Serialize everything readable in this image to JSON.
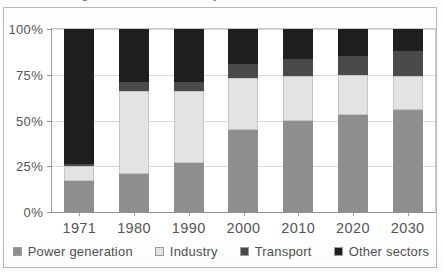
{
  "figure": {
    "title_cropped": "Figure 1: CO2 emissions by sector",
    "background_color": "#ffffff",
    "frame_color": "#b9b9b9"
  },
  "axis": {
    "y_ticks": [
      "0%",
      "25%",
      "50%",
      "75%",
      "100%"
    ],
    "y_tick_values": [
      0,
      25,
      50,
      75,
      100
    ],
    "x_labels": [
      "1971",
      "1980",
      "1990",
      "2000",
      "2010",
      "2020",
      "2030"
    ]
  },
  "legend": {
    "position": "bottom-center",
    "items": [
      {
        "label": "Power generation",
        "color": "#8e8e8e"
      },
      {
        "label": "Industry",
        "color": "#e3e3e3"
      },
      {
        "label": "Transport",
        "color": "#4a4a4a"
      },
      {
        "label": "Other sectors",
        "color": "#1f1f1f"
      }
    ]
  },
  "chart_data": {
    "type": "bar",
    "stacked": true,
    "normalized_percent": true,
    "title": "Figure 1: CO2 emissions by sector",
    "xlabel": "",
    "ylabel": "",
    "ylim": [
      0,
      100
    ],
    "grid": true,
    "legend_position": "bottom-center",
    "categories": [
      "1971",
      "1980",
      "1990",
      "2000",
      "2010",
      "2020",
      "2030"
    ],
    "series": [
      {
        "name": "Power generation",
        "color": "#8e8e8e",
        "values": [
          17,
          21,
          27,
          45,
          49.5,
          53,
          56
        ]
      },
      {
        "name": "Industry",
        "color": "#e3e3e3",
        "values": [
          8,
          45,
          39,
          28,
          25,
          22,
          18.5
        ]
      },
      {
        "name": "Transport",
        "color": "#4a4a4a",
        "values": [
          1.5,
          5,
          5,
          8,
          9,
          10.5,
          13.5
        ]
      },
      {
        "name": "Other sectors",
        "color": "#1f1f1f",
        "values": [
          73.5,
          29,
          29,
          19,
          16.5,
          14.5,
          12
        ]
      }
    ],
    "cumulative_tops": {
      "1971": [
        17,
        25,
        26.5,
        100
      ],
      "1980": [
        21,
        66,
        71,
        100
      ],
      "1990": [
        27,
        66,
        71,
        100
      ],
      "2000": [
        45,
        73,
        81,
        100
      ],
      "2010": [
        49.5,
        74.5,
        83.5,
        100
      ],
      "2020": [
        53,
        75,
        85.5,
        100
      ],
      "2030": [
        56,
        74.5,
        88,
        100
      ]
    }
  }
}
